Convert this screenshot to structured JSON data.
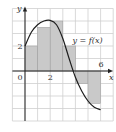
{
  "chart_data": {
    "type": "area",
    "title": "",
    "xlabel": "x",
    "ylabel": "y",
    "xlim": [
      -1,
      7
    ],
    "ylim": [
      -4,
      5
    ],
    "grid": true,
    "x_tick_labels": [
      {
        "value": 0,
        "label": "0"
      },
      {
        "value": 2,
        "label": "2"
      },
      {
        "value": 6,
        "label": "6"
      }
    ],
    "y_tick_labels": [
      {
        "value": 2,
        "label": "2"
      }
    ],
    "curve_label": "y = f(x)",
    "curve": {
      "x": [
        0,
        0.5,
        1,
        1.5,
        2,
        2.5,
        3,
        3.5,
        4,
        4.5,
        5,
        5.5,
        6
      ],
      "y": [
        2,
        3.1,
        3.7,
        4.0,
        4.05,
        3.7,
        2.6,
        1.0,
        -0.5,
        -1.6,
        -2.4,
        -2.9,
        -3.1
      ]
    },
    "rectangles": [
      {
        "x0": 0,
        "x1": 1,
        "height": 2
      },
      {
        "x0": 1,
        "x1": 2,
        "height": 3.5
      },
      {
        "x0": 2,
        "x1": 3,
        "height": 4
      },
      {
        "x0": 3,
        "x1": 4,
        "height": 2
      },
      {
        "x0": 4,
        "x1": 5,
        "height": -1
      },
      {
        "x0": 5,
        "x1": 6,
        "height": -2.6
      }
    ],
    "colors": {
      "fill": "#c9c9c9",
      "grid": "#cfcfcf",
      "axis": "#222222",
      "curve": "#1e1e1e"
    }
  },
  "labels": {
    "y_axis": "y",
    "x_axis": "x",
    "origin": "0",
    "x_tick_2": "2",
    "x_tick_6": "6",
    "y_tick_2": "2",
    "curve": "y = f(x)"
  }
}
